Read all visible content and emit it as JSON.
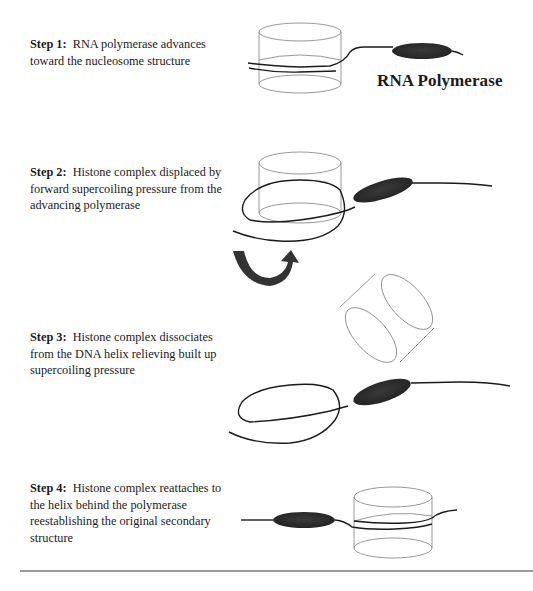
{
  "diagram": {
    "labels": {
      "polymerase": "RNA Polymerase"
    },
    "steps": [
      {
        "label": "Step 1:",
        "text": "RNA polymerase advances toward the nucleosome structure"
      },
      {
        "label": "Step 2:",
        "text": "Histone complex displaced by forward supercoiling pressure from the advancing polymerase"
      },
      {
        "label": "Step 3:",
        "text": "Histone complex dissociates from the DNA helix relieving built up supercoiling pressure"
      },
      {
        "label": "Step 4:",
        "text": "Histone complex reattaches to the helix behind the polymerase reestablishing the original secondary structure"
      }
    ],
    "colors": {
      "histone_outline": "#8c8c8c",
      "dna_strand": "#1a1a1a",
      "polymerase_fill": "#2e2e2e",
      "rotation_arrow": "#333333",
      "divider": "#9a9a9a"
    }
  }
}
